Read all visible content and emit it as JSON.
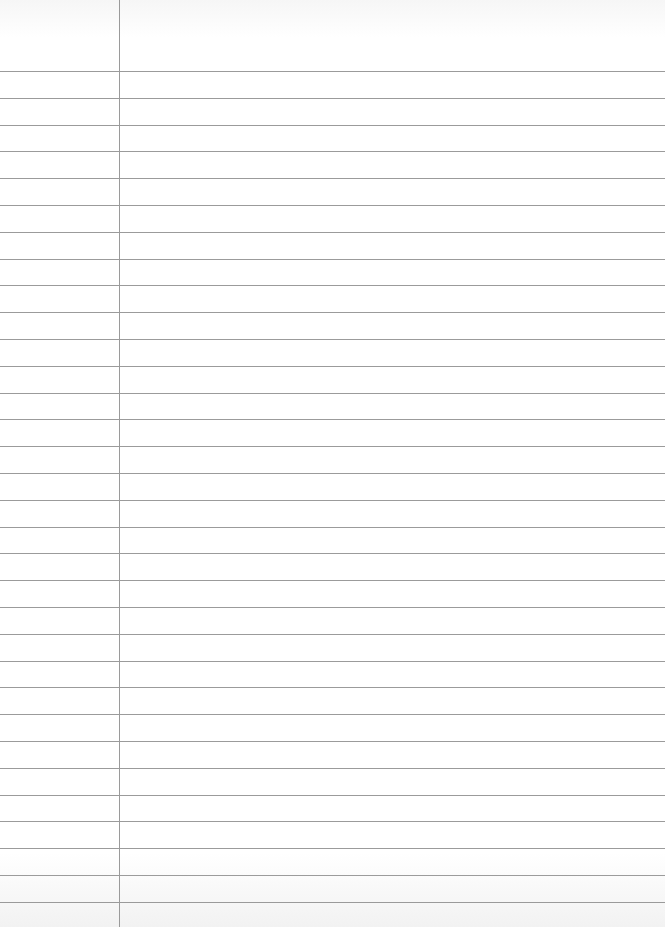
{
  "paper": {
    "type": "ruled notebook paper",
    "width": 665,
    "height": 927,
    "background_color": "#ffffff",
    "rule_color": "#8a8a8a",
    "margin_line_color": "#9a9a9a",
    "margin_line_x": 119,
    "first_rule_y": 71,
    "rule_spacing": 26.8,
    "rule_count": 32
  }
}
